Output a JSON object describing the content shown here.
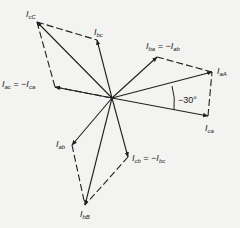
{
  "diagram": {
    "type": "phasor-diagram",
    "origin": [
      112,
      98
    ],
    "colors": {
      "line": "#1f1f1f",
      "background": "#f3f3f1"
    },
    "solid_vectors": [
      {
        "id": "I_cC",
        "to": [
          37,
          22
        ]
      },
      {
        "id": "I_bc",
        "to": [
          97,
          40
        ]
      },
      {
        "id": "I_ba",
        "to": [
          157,
          57
        ]
      },
      {
        "id": "I_aA",
        "to": [
          212,
          72
        ]
      },
      {
        "id": "I_ca",
        "to": [
          208,
          116
        ]
      },
      {
        "id": "I_cb",
        "to": [
          128,
          157
        ]
      },
      {
        "id": "I_bB",
        "to": [
          85,
          205
        ]
      },
      {
        "id": "I_ab",
        "to": [
          72,
          145
        ]
      },
      {
        "id": "I_ac",
        "to": [
          55,
          87
        ]
      }
    ],
    "dashed_segments": [
      {
        "from": [
          37,
          22
        ],
        "to": [
          97,
          40
        ]
      },
      {
        "from": [
          55,
          87
        ],
        "to": [
          112,
          98
        ]
      },
      {
        "from": [
          37,
          22
        ],
        "to": [
          55,
          87
        ]
      },
      {
        "from": [
          157,
          57
        ],
        "to": [
          212,
          72
        ]
      },
      {
        "from": [
          208,
          116
        ],
        "to": [
          212,
          72
        ]
      },
      {
        "from": [
          128,
          157
        ],
        "to": [
          85,
          205
        ]
      },
      {
        "from": [
          72,
          145
        ],
        "to": [
          85,
          205
        ]
      }
    ],
    "labels": {
      "I_cC": {
        "main": "I",
        "sub": "cC",
        "pos": [
          26,
          10
        ]
      },
      "I_bc": {
        "main": "I",
        "sub": "bc",
        "pos": [
          94,
          28
        ]
      },
      "I_ba": {
        "main": "I",
        "sub": "ba",
        "suffix": " = −I",
        "suffix_sub": "ab",
        "pos": [
          146,
          42
        ]
      },
      "I_aA": {
        "main": "I",
        "sub": "aA",
        "pos": [
          217,
          67
        ]
      },
      "I_ca": {
        "main": "I",
        "sub": "ca",
        "pos": [
          205,
          124
        ]
      },
      "I_cb": {
        "main": "I",
        "sub": "cb",
        "suffix": " = −I",
        "suffix_sub": "bc",
        "pos": [
          132,
          154
        ]
      },
      "I_bB": {
        "main": "I",
        "sub": "bB",
        "pos": [
          80,
          210
        ]
      },
      "I_ab": {
        "main": "I",
        "sub": "ab",
        "pos": [
          56,
          140
        ]
      },
      "I_ac": {
        "main": "I",
        "sub": "ac",
        "suffix": " = −I",
        "suffix_sub": "ca",
        "pos": [
          2,
          80
        ]
      }
    },
    "angle": {
      "text": "−30°",
      "pos": [
        178,
        95
      ]
    }
  }
}
